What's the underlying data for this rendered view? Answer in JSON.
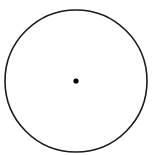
{
  "diagram": {
    "type": "circle-with-center-point",
    "shapes": [
      {
        "kind": "circle",
        "name": "outer-circle",
        "stroke": "#1a1a1a",
        "fill": "none"
      },
      {
        "kind": "point",
        "name": "center-point",
        "fill": "#000000"
      }
    ]
  }
}
